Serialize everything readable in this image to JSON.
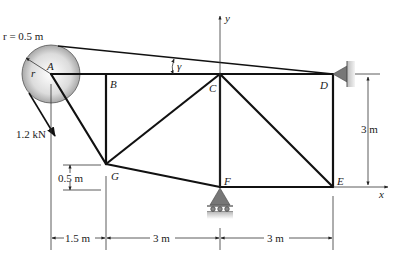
{
  "diagram": {
    "type": "truss",
    "nodes": {
      "A": {
        "label": "A",
        "x": 51,
        "y": 74
      },
      "B": {
        "label": "B",
        "x": 106,
        "y": 74
      },
      "C": {
        "label": "C",
        "x": 220,
        "y": 74
      },
      "D": {
        "label": "D",
        "x": 333,
        "y": 74
      },
      "E": {
        "label": "E",
        "x": 333,
        "y": 187
      },
      "F": {
        "label": "F",
        "x": 220,
        "y": 187
      },
      "G": {
        "label": "G",
        "x": 106,
        "y": 164
      }
    },
    "members": [
      "A-B",
      "B-C",
      "C-D",
      "A-G",
      "B-G",
      "G-C",
      "G-F",
      "C-F",
      "C-E",
      "D-E",
      "F-E"
    ],
    "pulley": {
      "radius_label": "r = 0.5 m",
      "radius_symbol": "r"
    },
    "cable_angle_label": "γ",
    "load": {
      "label": "1.2 kN"
    },
    "axes": {
      "x_label": "x",
      "y_label": "y"
    },
    "dimensions": {
      "horizontal": [
        "1.5 m",
        "3 m",
        "3 m"
      ],
      "vertical_height": "3 m",
      "g_offset": "0.5 m"
    },
    "supports": {
      "D": "pin",
      "F": "roller"
    }
  }
}
